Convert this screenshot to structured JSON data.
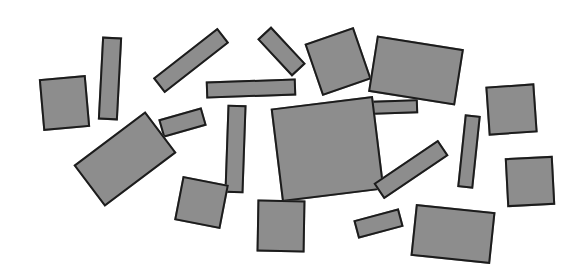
{
  "scene": {
    "title": "Scattered Rectangles",
    "background_color": "#ffffff",
    "width": 580,
    "height": 277,
    "shape_fill_color": "#8d8d8d",
    "shape_outline_color": "#1c1c1c",
    "shape_outline_width": 2,
    "shape_count": 20
  },
  "shapes": [
    {
      "id": "rect-01",
      "label": "square-left-edge",
      "x": 41,
      "y": 77,
      "w": 47,
      "h": 52,
      "rotation": -5
    },
    {
      "id": "rect-02",
      "label": "tall-bar-upper-left",
      "x": 100,
      "y": 37,
      "w": 20,
      "h": 83,
      "rotation": 3
    },
    {
      "id": "rect-03",
      "label": "diagonal-bar-upper-left",
      "x": 150,
      "y": 51,
      "w": 82,
      "h": 19,
      "rotation": -38
    },
    {
      "id": "rect-04",
      "label": "horizontal-bar-upper-center",
      "x": 206,
      "y": 80,
      "w": 90,
      "h": 17,
      "rotation": -2
    },
    {
      "id": "rect-05",
      "label": "diagonal-bar-upper-center",
      "x": 256,
      "y": 42,
      "w": 51,
      "h": 19,
      "rotation": 47
    },
    {
      "id": "rect-06",
      "label": "square-upper-center",
      "x": 312,
      "y": 34,
      "w": 52,
      "h": 55,
      "rotation": -19
    },
    {
      "id": "rect-07",
      "label": "large-rect-upper-right",
      "x": 372,
      "y": 42,
      "w": 88,
      "h": 57,
      "rotation": 9
    },
    {
      "id": "rect-08",
      "label": "small-bar-right-of-center",
      "x": 372,
      "y": 100,
      "w": 46,
      "h": 14,
      "rotation": -2
    },
    {
      "id": "rect-09",
      "label": "square-right-edge-upper",
      "x": 487,
      "y": 85,
      "w": 49,
      "h": 49,
      "rotation": -4
    },
    {
      "id": "rect-10",
      "label": "small-bar-mid-left",
      "x": 160,
      "y": 113,
      "w": 45,
      "h": 19,
      "rotation": -16
    },
    {
      "id": "rect-11",
      "label": "large-rect-lower-left",
      "x": 80,
      "y": 133,
      "w": 90,
      "h": 52,
      "rotation": -37
    },
    {
      "id": "rect-12",
      "label": "tall-bar-center",
      "x": 226,
      "y": 105,
      "w": 19,
      "h": 88,
      "rotation": 2
    },
    {
      "id": "rect-13",
      "label": "large-square-center",
      "x": 276,
      "y": 102,
      "w": 103,
      "h": 94,
      "rotation": -7
    },
    {
      "id": "rect-14",
      "label": "tall-bar-right-of-center",
      "x": 461,
      "y": 115,
      "w": 16,
      "h": 73,
      "rotation": 6
    },
    {
      "id": "rect-15",
      "label": "square-right-edge-lower",
      "x": 506,
      "y": 157,
      "w": 48,
      "h": 49,
      "rotation": -3
    },
    {
      "id": "rect-16",
      "label": "diagonal-bar-lower-right",
      "x": 372,
      "y": 160,
      "w": 78,
      "h": 19,
      "rotation": -34
    },
    {
      "id": "rect-17",
      "label": "square-lower-left",
      "x": 178,
      "y": 180,
      "w": 47,
      "h": 45,
      "rotation": 11
    },
    {
      "id": "rect-18",
      "label": "square-lower-center",
      "x": 257,
      "y": 200,
      "w": 48,
      "h": 52,
      "rotation": 1
    },
    {
      "id": "rect-19",
      "label": "small-bar-lower-center",
      "x": 355,
      "y": 214,
      "w": 47,
      "h": 19,
      "rotation": -15
    },
    {
      "id": "rect-20",
      "label": "large-rect-lower-right",
      "x": 413,
      "y": 208,
      "w": 80,
      "h": 52,
      "rotation": 6
    }
  ]
}
